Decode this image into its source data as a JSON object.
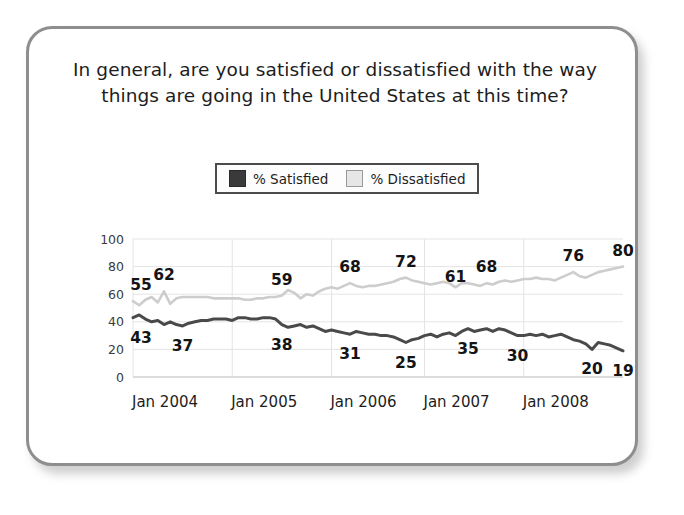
{
  "card": {
    "title": "In general, are you satisfied or dissatisfied with the way things are going in the United States at this time?"
  },
  "legend": {
    "items": [
      {
        "label": "% Satisfied",
        "swatch": "dark-square-icon",
        "color": "#3a3a3a"
      },
      {
        "label": "% Dissatisfied",
        "swatch": "light-square-icon",
        "color": "#e6e6e6"
      }
    ]
  },
  "chart_data": {
    "type": "line",
    "title": "In general, are you satisfied or dissatisfied with the way things are going in the United States at this time?",
    "xlabel": "",
    "ylabel": "",
    "ylim": [
      0,
      100
    ],
    "yticks": [
      0,
      20,
      40,
      60,
      80,
      100
    ],
    "xticks": [
      "Jan 2004",
      "Jan 2005",
      "Jan 2006",
      "Jan 2007",
      "Jan 2008"
    ],
    "grid": true,
    "legend_position": "top-center",
    "series": [
      {
        "name": "% Dissatisfied",
        "color": "#cdcdcd",
        "values": [
          55,
          52,
          56,
          58,
          54,
          62,
          53,
          57,
          58,
          58,
          58,
          58,
          58,
          57,
          57,
          57,
          57,
          57,
          56,
          56,
          57,
          57,
          58,
          58,
          59,
          63,
          61,
          57,
          60,
          59,
          62,
          64,
          65,
          64,
          66,
          68,
          66,
          65,
          66,
          66,
          67,
          68,
          69,
          71,
          72,
          70,
          69,
          68,
          67,
          68,
          69,
          68,
          65,
          68,
          68,
          67,
          66,
          68,
          67,
          69,
          70,
          69,
          70,
          71,
          71,
          72,
          71,
          71,
          70,
          72,
          74,
          76,
          73,
          72,
          74,
          76,
          77,
          78,
          79,
          80
        ],
        "labeled_points": [
          {
            "index": 0,
            "value": 55,
            "label": "55"
          },
          {
            "index": 5,
            "value": 62,
            "label": "62"
          },
          {
            "index": 24,
            "value": 59,
            "label": "59"
          },
          {
            "index": 35,
            "value": 68,
            "label": "68"
          },
          {
            "index": 44,
            "value": 72,
            "label": "72"
          },
          {
            "index": 52,
            "value": 61,
            "label": "61"
          },
          {
            "index": 57,
            "value": 68,
            "label": "68"
          },
          {
            "index": 71,
            "value": 76,
            "label": "76"
          },
          {
            "index": 79,
            "value": 80,
            "label": "80"
          }
        ]
      },
      {
        "name": "% Satisfied",
        "color": "#4a4a4a",
        "values": [
          43,
          45,
          42,
          40,
          41,
          38,
          40,
          38,
          37,
          39,
          40,
          41,
          41,
          42,
          42,
          42,
          41,
          43,
          43,
          42,
          42,
          43,
          43,
          42,
          38,
          36,
          37,
          38,
          36,
          37,
          35,
          33,
          34,
          33,
          32,
          31,
          33,
          32,
          31,
          31,
          30,
          30,
          29,
          27,
          25,
          27,
          28,
          30,
          31,
          29,
          31,
          32,
          30,
          33,
          35,
          33,
          34,
          35,
          33,
          35,
          34,
          32,
          30,
          30,
          31,
          30,
          31,
          29,
          30,
          31,
          29,
          27,
          26,
          24,
          20,
          25,
          24,
          23,
          21,
          19
        ],
        "labeled_points": [
          {
            "index": 0,
            "value": 43,
            "label": "43"
          },
          {
            "index": 8,
            "value": 37,
            "label": "37"
          },
          {
            "index": 24,
            "value": 38,
            "label": "38"
          },
          {
            "index": 35,
            "value": 31,
            "label": "31"
          },
          {
            "index": 44,
            "value": 25,
            "label": "25"
          },
          {
            "index": 54,
            "value": 35,
            "label": "35"
          },
          {
            "index": 62,
            "value": 30,
            "label": "30"
          },
          {
            "index": 74,
            "value": 20,
            "label": "20"
          },
          {
            "index": 79,
            "value": 19,
            "label": "19"
          }
        ]
      }
    ]
  }
}
